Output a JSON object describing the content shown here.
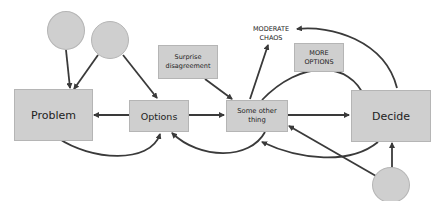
{
  "diagram": {
    "nodes": {
      "problem": "Problem",
      "options": "Options",
      "surprise": "Surprise disagreement",
      "some_other": "Some other thing",
      "moderate_chaos": "MODERATE CHAOS",
      "more_options": "MORE OPTIONS",
      "decide": "Decide"
    },
    "circles": [
      "circle-top-left",
      "circle-top-middle",
      "circle-bottom-right"
    ],
    "edges": [
      {
        "from": "circle-top-left",
        "to": "Problem"
      },
      {
        "from": "circle-top-middle",
        "to": "Problem"
      },
      {
        "from": "circle-top-middle",
        "to": "Options"
      },
      {
        "from": "Options",
        "to": "Problem"
      },
      {
        "from": "Options",
        "to": "Some other thing"
      },
      {
        "from": "Problem",
        "to": "Options",
        "style": "curve-below"
      },
      {
        "from": "Surprise disagreement",
        "to": "Some other thing"
      },
      {
        "from": "Some other thing",
        "to": "MODERATE CHAOS"
      },
      {
        "from": "Some other thing",
        "to": "Decide"
      },
      {
        "from": "Some other thing",
        "to": "Decide",
        "style": "curve-above"
      },
      {
        "from": "Some other thing",
        "to": "Options",
        "style": "curve-below"
      },
      {
        "from": "Decide",
        "to": "MODERATE CHAOS",
        "style": "curve-above",
        "bidirectional": true
      },
      {
        "from": "Decide",
        "to": "Some other thing",
        "style": "curve-below"
      },
      {
        "from": "circle-bottom-right",
        "to": "Decide"
      },
      {
        "from": "circle-bottom-right",
        "to": "Some other thing"
      }
    ],
    "colors": {
      "node_fill": "#cfcfcf",
      "node_border": "#b5b5b5",
      "edge": "#3a3a3a",
      "text": "#222222"
    }
  }
}
